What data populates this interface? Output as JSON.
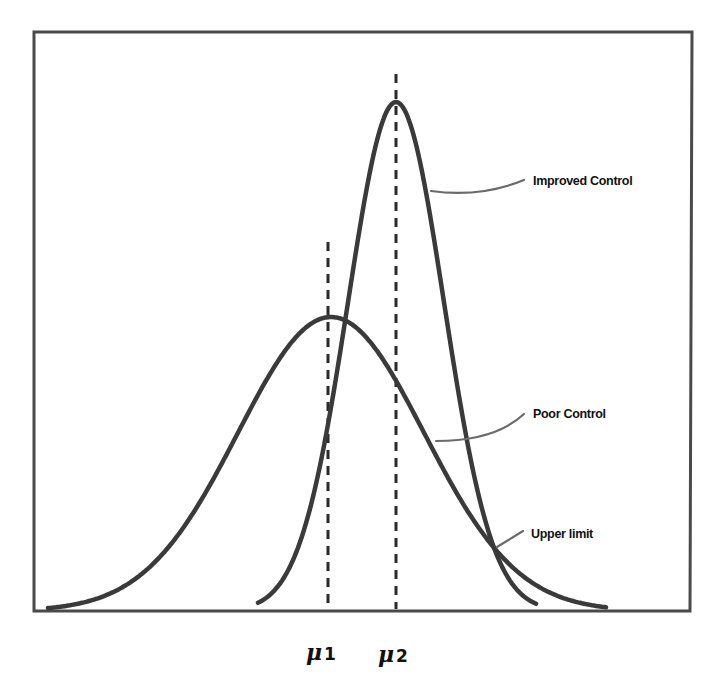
{
  "figure": {
    "labels": {
      "improved": "Improved Control",
      "poor": "Poor Control",
      "upper_limit": "Upper limit"
    },
    "axis_labels": {
      "mu1_symbol": "μ",
      "mu1_sub": "1",
      "mu2_symbol": "μ",
      "mu2_sub": "2"
    },
    "colors": {
      "curve": "#3a3a3a",
      "frame": "#4a4a4a",
      "leader": "#6a6a6a",
      "text": "#111111"
    }
  },
  "chart_data": {
    "type": "line",
    "title": "",
    "xlabel": "",
    "ylabel": "",
    "grid": false,
    "series": [
      {
        "name": "Poor Control",
        "distribution": "normal",
        "mean_label": "μ1",
        "relative_peak": 0.58,
        "relative_sigma": 1.94
      },
      {
        "name": "Improved Control",
        "distribution": "normal",
        "mean_label": "μ2",
        "relative_peak": 1.0,
        "relative_sigma": 1.0
      }
    ],
    "annotations": [
      "Improved Control",
      "Poor Control",
      "Upper limit"
    ],
    "x_ticks": [
      "μ1",
      "μ2"
    ]
  }
}
